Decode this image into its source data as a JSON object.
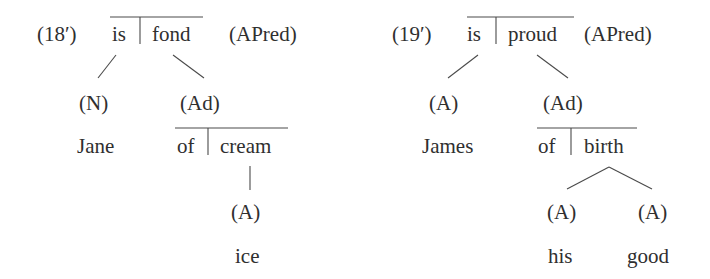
{
  "diagram": {
    "colors": {
      "text": "#2f2f2f",
      "line": "#4a4a4a",
      "background": "#ffffff"
    },
    "left_tree": {
      "label": "(18′)",
      "root": {
        "head": "is",
        "complement": "fond",
        "category": "(APred)"
      },
      "children": [
        {
          "category": "(N)",
          "word": "Jane"
        },
        {
          "category": "(Ad)",
          "head": "of",
          "complement": "cream",
          "children": [
            {
              "category": "(A)",
              "word": "ice"
            }
          ]
        }
      ]
    },
    "right_tree": {
      "label": "(19′)",
      "root": {
        "head": "is",
        "complement": "proud",
        "category": "(APred)"
      },
      "children": [
        {
          "category": "(A)",
          "word": "James"
        },
        {
          "category": "(Ad)",
          "head": "of",
          "complement": "birth",
          "children": [
            {
              "category": "(A)",
              "word": "his"
            },
            {
              "category": "(A)",
              "word": "good"
            }
          ]
        }
      ]
    }
  }
}
